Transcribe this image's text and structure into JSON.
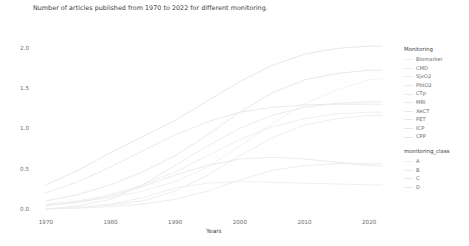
{
  "chart_data": {
    "type": "line",
    "title": "Number of articles published from 1970 to 2022 for different monitoring.",
    "xlabel": "Years",
    "ylabel": "Number of articles (logarithmic scale)",
    "xlim": [
      1968,
      2024
    ],
    "ylim": [
      -0.05,
      2.12
    ],
    "grid": false,
    "x_ticks": [
      "1970",
      "1980",
      "1990",
      "2000",
      "2010",
      "2020"
    ],
    "x_tick_values": [
      1970,
      1980,
      1990,
      2000,
      2010,
      2020
    ],
    "y_ticks": [
      "0.0",
      "0.5",
      "1.0",
      "1.5",
      "2.0"
    ],
    "y_tick_values": [
      0.0,
      0.5,
      1.0,
      1.5,
      2.0
    ],
    "legend_position": "right",
    "legends": [
      {
        "title": "Monitoring",
        "entries": [
          {
            "label": "Biomarker",
            "color": "#f1f1f3"
          },
          {
            "label": "CMD",
            "color": "#eeeef1"
          },
          {
            "label": "SjvO2",
            "color": "#ededf0"
          },
          {
            "label": "PbtO2",
            "color": "#ececef"
          },
          {
            "label": "CTp",
            "color": "#ebebee"
          },
          {
            "label": "MRI",
            "color": "#eaeaed"
          },
          {
            "label": "XeCT",
            "color": "#e9e9ec"
          },
          {
            "label": "PET",
            "color": "#e8e8eb"
          },
          {
            "label": "ICP",
            "color": "#e6e6ea"
          },
          {
            "label": "CPP",
            "color": "#e5e5e9"
          }
        ]
      },
      {
        "title": "monitoring_class",
        "entries": [
          {
            "label": "A",
            "color": "#efeff2"
          },
          {
            "label": "B",
            "color": "#ececef"
          },
          {
            "label": "C",
            "color": "#e9e9ed"
          },
          {
            "label": "D",
            "color": "#e6e6ea"
          }
        ]
      }
    ],
    "x": [
      1970,
      1975,
      1980,
      1985,
      1990,
      1995,
      2000,
      2005,
      2010,
      2015,
      2020,
      2022
    ],
    "series": [
      {
        "name": "ICP",
        "color": "#e5e5e9",
        "values": [
          0.3,
          0.48,
          0.7,
          0.9,
          1.1,
          1.34,
          1.58,
          1.78,
          1.92,
          1.99,
          2.02,
          2.02
        ]
      },
      {
        "name": "CPP",
        "color": "#e6e6ea",
        "values": [
          0.1,
          0.18,
          0.3,
          0.46,
          0.66,
          0.92,
          1.2,
          1.44,
          1.6,
          1.68,
          1.72,
          1.72
        ]
      },
      {
        "name": "Biomarker",
        "color": "#f1f1f3",
        "values": [
          0.05,
          0.09,
          0.14,
          0.22,
          0.34,
          0.52,
          0.78,
          1.06,
          1.3,
          1.48,
          1.6,
          1.62
        ]
      },
      {
        "name": "MRI",
        "color": "#eaeaed",
        "values": [
          0.0,
          0.04,
          0.12,
          0.3,
          0.54,
          0.78,
          1.0,
          1.16,
          1.26,
          1.31,
          1.33,
          1.33
        ]
      },
      {
        "name": "PET",
        "color": "#e8e8eb",
        "values": [
          0.2,
          0.34,
          0.52,
          0.72,
          0.92,
          1.08,
          1.2,
          1.26,
          1.29,
          1.3,
          1.3,
          1.3
        ]
      },
      {
        "name": "SjvO2",
        "color": "#ededf0",
        "values": [
          0.06,
          0.1,
          0.18,
          0.3,
          0.46,
          0.66,
          0.86,
          1.02,
          1.12,
          1.18,
          1.2,
          1.2
        ]
      },
      {
        "name": "PbtO2",
        "color": "#ececef",
        "values": [
          0.0,
          0.02,
          0.05,
          0.1,
          0.22,
          0.42,
          0.66,
          0.88,
          1.04,
          1.12,
          1.16,
          1.16
        ]
      },
      {
        "name": "XeCT",
        "color": "#e9e9ec",
        "values": [
          0.04,
          0.08,
          0.16,
          0.28,
          0.42,
          0.54,
          0.62,
          0.64,
          0.62,
          0.58,
          0.54,
          0.53
        ]
      },
      {
        "name": "CTp",
        "color": "#ebebee",
        "values": [
          0.0,
          0.01,
          0.03,
          0.06,
          0.12,
          0.22,
          0.36,
          0.48,
          0.54,
          0.56,
          0.56,
          0.56
        ]
      },
      {
        "name": "CMD",
        "color": "#eeeef1",
        "values": [
          0.0,
          0.02,
          0.06,
          0.14,
          0.26,
          0.32,
          0.34,
          0.33,
          0.32,
          0.31,
          0.3,
          0.3
        ]
      }
    ]
  }
}
